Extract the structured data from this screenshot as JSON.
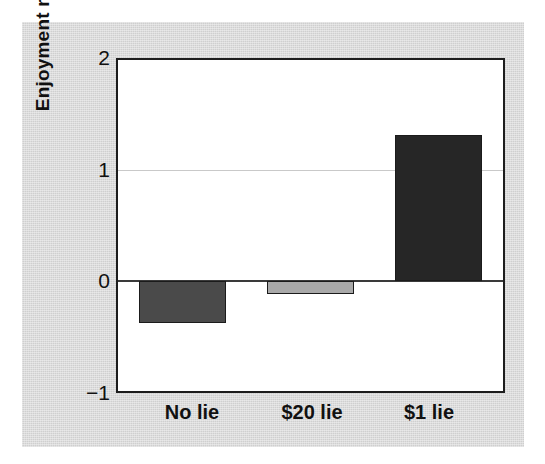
{
  "chart_data": {
    "type": "bar",
    "title": "",
    "subtitle": "",
    "xlabel": "",
    "ylabel": "Enjoyment rating",
    "categories": [
      "No lie",
      "$20 lie",
      "$1 lie"
    ],
    "values": [
      -0.38,
      -0.12,
      1.32
    ],
    "series": [
      {
        "name": "Enjoyment rating",
        "values": [
          -0.38,
          -0.12,
          1.32
        ]
      }
    ],
    "bar_colors": [
      "#4a4a4a",
      "#a9a9a9",
      "#262626"
    ],
    "ylim": [
      -1,
      2
    ],
    "yticks": [
      2,
      1,
      0,
      -1
    ],
    "ytick_labels": [
      "2",
      "1",
      "0",
      "−1"
    ],
    "grid": true,
    "gridlines_at": [
      1
    ],
    "zero_line": 0,
    "legend": "none",
    "legend_position": "none",
    "annotations": []
  },
  "style": {
    "figure_background": "#ffffff",
    "panel_background": "#dcdcdc",
    "plot_background": "#ffffff",
    "axis_color": "#1d1d1d",
    "gridline_color": "#c9c9c9",
    "zero_line_color": "#3a3a3a",
    "text_color": "#111111"
  }
}
